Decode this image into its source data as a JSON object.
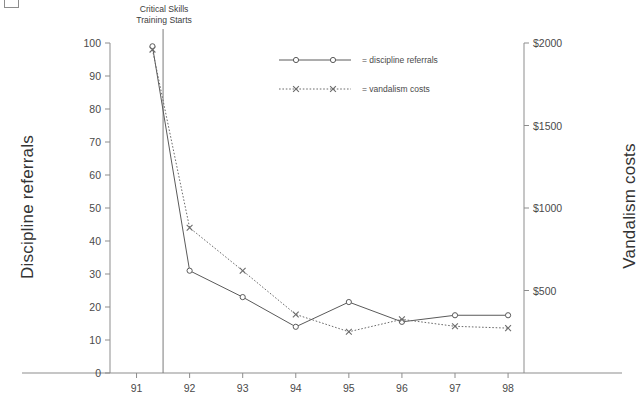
{
  "chart_data": {
    "type": "line",
    "title": "",
    "xlabel": "",
    "ylabel": "Discipline referrals",
    "y2label": "Vandalism costs",
    "categories": [
      "91",
      "92",
      "93",
      "94",
      "95",
      "96",
      "97",
      "98"
    ],
    "x_tick_labels": [
      "91",
      "92",
      "93",
      "94",
      "95",
      "96",
      "97",
      "98"
    ],
    "xlim": [
      90.5,
      98.3
    ],
    "ylim": [
      0,
      100
    ],
    "y_tick_labels": [
      "0",
      "10",
      "20",
      "30",
      "40",
      "50",
      "60",
      "70",
      "80",
      "90",
      "100"
    ],
    "y_ticks": [
      0,
      10,
      20,
      30,
      40,
      50,
      60,
      70,
      80,
      90,
      100
    ],
    "y2lim": [
      0,
      2000
    ],
    "y2_tick_labels": [
      "$500",
      "$1000",
      "$1500",
      "$2000"
    ],
    "y2_ticks": [
      500,
      1000,
      1500,
      2000
    ],
    "grid": false,
    "legend_position": "upper center",
    "series": [
      {
        "name": "discipline referrals",
        "axis": "left",
        "style": "solid",
        "marker": "circle",
        "color": "#5a5a5a",
        "x": [
          91.3,
          92,
          93,
          94,
          95,
          96,
          97,
          98
        ],
        "values": [
          99,
          31,
          23,
          14,
          21.5,
          15.5,
          17.5,
          17.5
        ]
      },
      {
        "name": "vandalism costs",
        "axis": "right",
        "style": "dotted",
        "marker": "x",
        "color": "#6b6b6b",
        "x": [
          91.3,
          92,
          93,
          94,
          95,
          96,
          97,
          98
        ],
        "values": [
          1960,
          880,
          620,
          355,
          250,
          325,
          283,
          272
        ]
      }
    ],
    "annotations": [
      {
        "name": "intervention-marker",
        "text_line1": "Critical Skills",
        "text_line2": "Training Starts",
        "x": 91.5,
        "type": "vline"
      }
    ],
    "legend_entries": [
      {
        "label": "= discipline referrals",
        "style": "solid",
        "marker": "circle"
      },
      {
        "label": "= vandalism costs",
        "style": "dotted",
        "marker": "x"
      }
    ]
  },
  "colors": {
    "axis": "#8d8d8d",
    "series1": "#5a5a5a",
    "series2": "#6b6b6b",
    "text": "#3f3f3f"
  }
}
